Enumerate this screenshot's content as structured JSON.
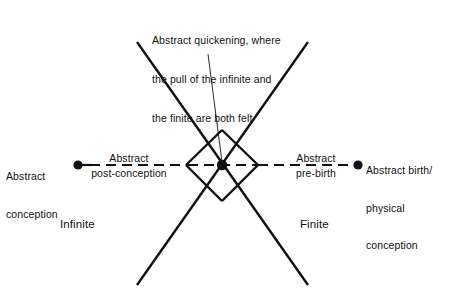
{
  "figure": {
    "background_color": "#ffffff",
    "stroke_color": "#111111",
    "caption": {
      "line1": "Abstract quickening, where",
      "line2": "the pull of the infinite and",
      "line3": "the finite are both felt"
    },
    "labels": {
      "abstract_conception": {
        "line1": "Abstract",
        "line2": "conception"
      },
      "abstract_post_conception": {
        "top": "Abstract",
        "bottom": "post-conception"
      },
      "abstract_pre_birth": {
        "top": "Abstract",
        "bottom": "pre-birth"
      },
      "abstract_birth_physical_conception": {
        "line1": "Abstract birth/",
        "line2": "physical",
        "line3": "conception"
      },
      "infinite": "Infinite",
      "finite": "Finite"
    },
    "nodes": [
      {
        "name": "abstract-conception-dot",
        "x": 78,
        "y": 165,
        "r": 4.6
      },
      {
        "name": "abstract-quickening-dot",
        "x": 222,
        "y": 165,
        "r": 5.2
      },
      {
        "name": "abstract-birth-dot",
        "x": 358,
        "y": 165,
        "r": 4.6
      }
    ],
    "axis": {
      "y": 165,
      "start_x": 78,
      "end_x": 358,
      "style": "dashed"
    },
    "diamond": {
      "left_x": 186,
      "right_x": 258,
      "top_y": 130,
      "bottom_y": 201,
      "center_y": 165
    },
    "diagonals": [
      {
        "name": "diagonal-nw-se",
        "x1": 137,
        "y1": 42,
        "x2": 308,
        "y2": 285
      },
      {
        "name": "diagonal-ne-sw",
        "x1": 308,
        "y1": 42,
        "x2": 137,
        "y2": 285
      }
    ],
    "leader_line": {
      "x1": 208,
      "y1": 54,
      "x2": 222,
      "y2": 163
    }
  }
}
